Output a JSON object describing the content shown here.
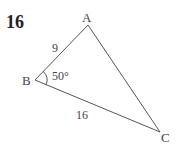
{
  "problem_number": "16",
  "triangle": {
    "vertices": {
      "A": "A",
      "B": "B",
      "C": "C"
    },
    "side_AB": "9",
    "side_BC": "16",
    "angle_B": "50°"
  },
  "colors": {
    "line": "#555555",
    "text": "#444444"
  }
}
